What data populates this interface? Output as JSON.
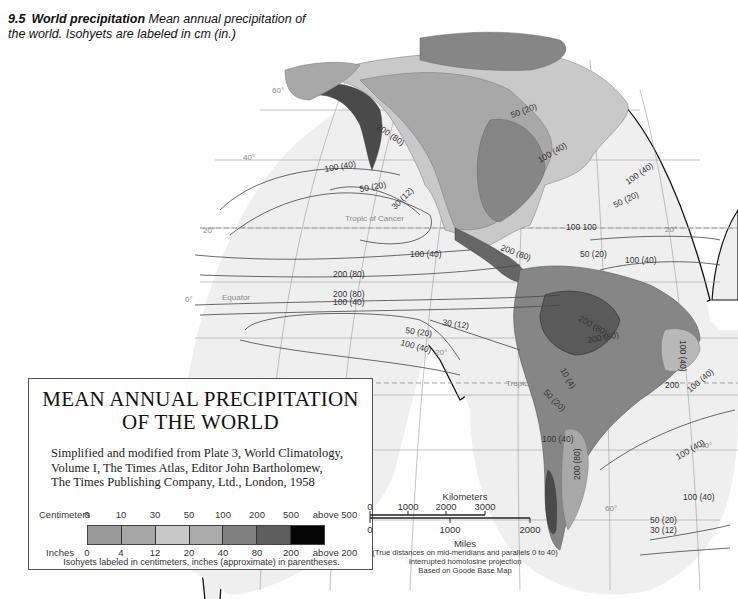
{
  "caption": {
    "number": "9.5",
    "title": "World precipitation",
    "text": "Mean annual precipitation of the world. Isohyets are labeled in cm (in.)"
  },
  "legend": {
    "title_line1": "MEAN ANNUAL PRECIPITATION",
    "title_line2": "OF THE WORLD",
    "source_line1": "Simplified and modified from Plate 3, World Climatology,",
    "source_line2": "Volume I, The Times Atlas, Editor John Bartholomew,",
    "source_line3": "The Times Publishing Company, Ltd., London, 1958",
    "cm_label": "Centimeters",
    "in_label": "Inches",
    "cm_ticks": [
      "0",
      "10",
      "30",
      "50",
      "100",
      "200",
      "500",
      "above 500"
    ],
    "in_ticks": [
      "0",
      "4",
      "12",
      "20",
      "40",
      "80",
      "200",
      "above 200"
    ],
    "class_colors": [
      "#9a9a9a",
      "#a6a6a6",
      "#c8c8c8",
      "#ababab",
      "#808080",
      "#5e5e5e",
      "#050505"
    ],
    "note": "Isohyets labeled in centimeters, inches (approximate) in parentheses."
  },
  "scale": {
    "km_label": "Kilometers",
    "km_ticks": [
      "0",
      "1000",
      "2000",
      "3000"
    ],
    "mi_ticks": [
      "0",
      "1000",
      "2000"
    ],
    "mi_label": "Miles",
    "note1": "(True distances on mid-meridians and parallels 0 to 40)",
    "note2": "Interrupted homolosine projection",
    "note3": "Based on Goode Base Map"
  },
  "map_labels": {
    "tropic_cancer": "Tropic of Cancer",
    "tropic_capricorn": "Tropic of Capricorn",
    "equator": "Equator",
    "lat_60": "60°",
    "lat_40": "40°",
    "lat_20": "20°",
    "lat_0": "0°",
    "iso_200_80": "200 (80)",
    "iso_100_40": "100 (40)",
    "iso_50_20": "50 (20)",
    "iso_30_12": "30 (12)",
    "iso_10_4": "10 (4)",
    "iso_100": "100",
    "iso_200": "200",
    "iso_100_100": "100 100"
  },
  "colors": {
    "ocean": "#efefef",
    "land_light": "#c9c9c9",
    "land_mid": "#a8a8a8",
    "land_dark": "#868686",
    "land_darker": "#666666",
    "land_darkest": "#4a4a4a",
    "grid": "#9a9a9a",
    "isohyet": "#444444"
  }
}
